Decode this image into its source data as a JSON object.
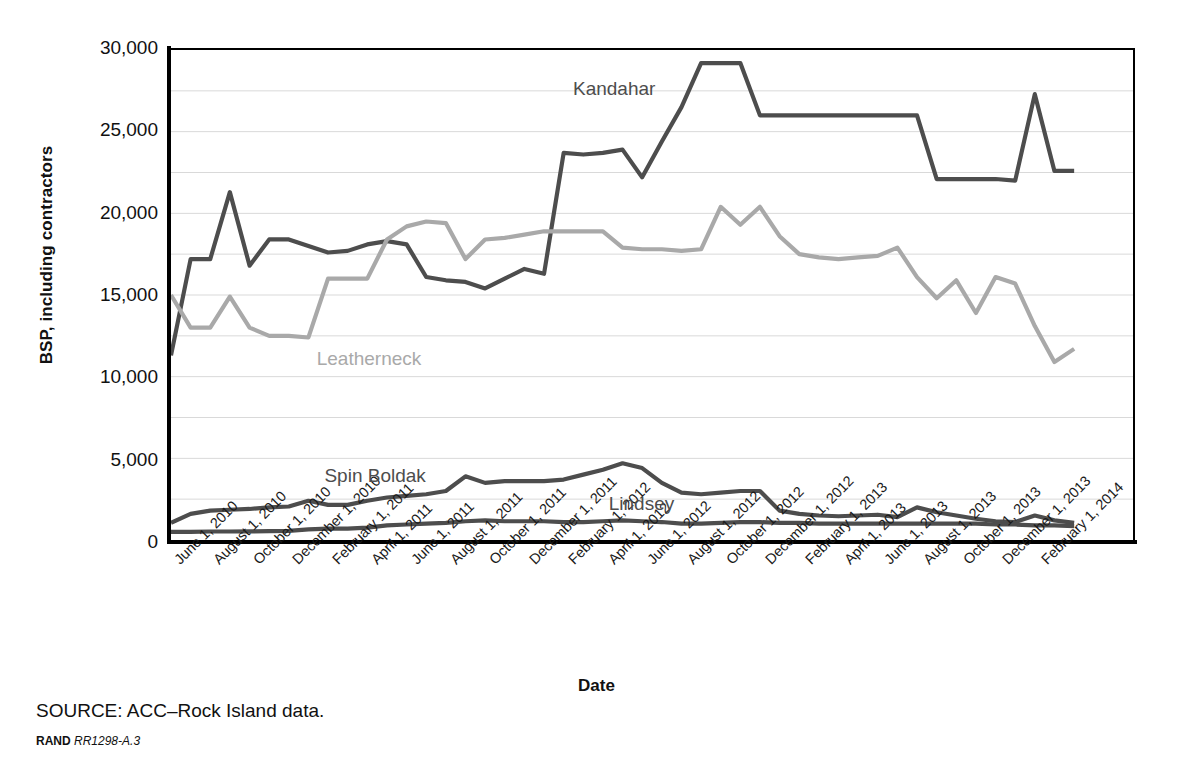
{
  "figure": {
    "source_note": "SOURCE: ACC–Rock Island data.",
    "rand_tag": "RAND",
    "rand_number": "RR1298-A.3"
  },
  "colors": {
    "dark_series": "#4d4d4d",
    "light_series": "#a9a9a9",
    "axis": "#000000",
    "grid": "#d9d9d9",
    "text": "#111111"
  },
  "chart_data": {
    "type": "line",
    "title": "",
    "xlabel": "Date",
    "ylabel": "BSP, including contractors",
    "ylim": [
      0,
      30000
    ],
    "ytick_values": [
      0,
      5000,
      10000,
      15000,
      20000,
      25000,
      30000
    ],
    "ytick_labels": [
      "0",
      "5,000",
      "10,000",
      "15,000",
      "20,000",
      "25,000",
      "30,000"
    ],
    "gridline_interval": 2500,
    "grid": true,
    "legend_position": "inline-annotations",
    "x_tick_labels": [
      "June 1, 2010",
      "August 1, 2010",
      "October 1, 2010",
      "December 1, 2010",
      "February 1, 2011",
      "April 1, 2011",
      "June 1, 2011",
      "August 1, 2011",
      "October 1, 2011",
      "December 1, 2011",
      "February 1, 2012",
      "April 1, 2012",
      "June 1, 2012",
      "August 1, 2012",
      "October 1, 2012",
      "December 1, 2012",
      "February 1, 2013",
      "April 1, 2013",
      "June 1, 2013",
      "August 1, 2013",
      "October 1, 2013",
      "December 1, 2013",
      "February 1, 2014"
    ],
    "x_tick_interval_months": 2,
    "x_point_interval_months": 1,
    "x_start": "June 1, 2010",
    "x_end": "April 1, 2014",
    "n_points": 47,
    "series": [
      {
        "name": "Kandahar",
        "color": "#4d4d4d",
        "label_x_index": 23,
        "values": [
          11300,
          17200,
          17200,
          21300,
          16800,
          18400,
          18400,
          18000,
          17600,
          17700,
          18100,
          18300,
          18100,
          16100,
          15900,
          15800,
          15400,
          16000,
          16600,
          16300,
          23700,
          23600,
          23700,
          23900,
          22200,
          24400,
          26500,
          29200,
          29200,
          29200,
          26000,
          26000,
          26000,
          26000,
          26000,
          26000,
          26000,
          26000,
          26000,
          22100,
          22100,
          22100,
          22100,
          22000,
          27300,
          22600,
          22600
        ]
      },
      {
        "name": "Leatherneck",
        "color": "#a9a9a9",
        "label_x_index": 9,
        "values": [
          15000,
          13000,
          13000,
          14900,
          13000,
          12500,
          12500,
          12400,
          16000,
          16000,
          16000,
          18400,
          19200,
          19500,
          19400,
          17200,
          18400,
          18500,
          18700,
          18900,
          18900,
          18900,
          18900,
          17900,
          17800,
          17800,
          17700,
          17800,
          20400,
          19300,
          20400,
          18600,
          17500,
          17300,
          17200,
          17300,
          17400,
          17900,
          16100,
          14800,
          15900,
          13900,
          16100,
          15700,
          13100,
          10900,
          11700,
          10800
        ]
      },
      {
        "name": "Spin Boldak",
        "color": "#4d4d4d",
        "label_x_index": 12,
        "values": [
          1050,
          1600,
          1800,
          1850,
          1900,
          2000,
          2050,
          2400,
          2150,
          2150,
          2400,
          2600,
          2700,
          2800,
          3000,
          3900,
          3500,
          3600,
          3600,
          3600,
          3700,
          4000,
          4300,
          4700,
          4400,
          3500,
          2900,
          2800,
          2900,
          3000,
          3000,
          1800,
          1600,
          1500,
          1450,
          1500,
          1550,
          1400,
          2000,
          1700,
          1500,
          1300,
          1150,
          1100,
          1500,
          1200,
          1050,
          400
        ]
      },
      {
        "name": "Lindsey",
        "color": "#4d4d4d",
        "label_x_index": 26,
        "values": [
          500,
          500,
          520,
          520,
          530,
          540,
          560,
          650,
          700,
          700,
          760,
          900,
          950,
          1000,
          1050,
          1150,
          1200,
          1150,
          1150,
          1150,
          1100,
          1100,
          1150,
          1200,
          1150,
          1100,
          1000,
          1000,
          1050,
          1100,
          1100,
          1050,
          1050,
          1000,
          1000,
          1000,
          1000,
          1000,
          1000,
          1000,
          1000,
          1000,
          950,
          950,
          900,
          900,
          850,
          800
        ]
      }
    ],
    "annotations": [
      {
        "text": "Kandahar",
        "color": "#4d4d4d"
      },
      {
        "text": "Leatherneck",
        "color": "#a9a9a9"
      },
      {
        "text": "Spin Boldak",
        "color": "#4d4d4d"
      },
      {
        "text": "Lindsey",
        "color": "#4d4d4d"
      }
    ]
  }
}
